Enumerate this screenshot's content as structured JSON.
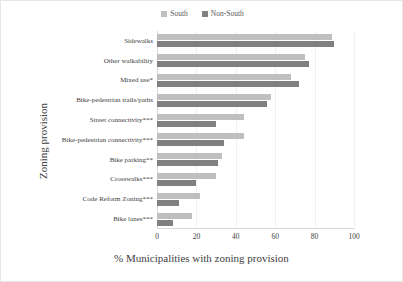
{
  "chart_data": {
    "type": "bar",
    "orientation": "horizontal",
    "title": "",
    "xlabel": "% Municipalities with zoning provision",
    "ylabel": "Zoning provision",
    "xlim": [
      0,
      100
    ],
    "xticks": [
      0,
      20,
      40,
      60,
      80,
      100
    ],
    "grid": true,
    "legend_position": "top-center",
    "categories": [
      "Sidewalks",
      "Other walkability",
      "Mixed use*",
      "Bike-pedestrian trails/paths",
      "Street connectivity***",
      "Bike-pedestrian connectivity***",
      "Bike parking**",
      "Crosswalks***",
      "Code Reform Zoning***",
      "Bike lanes***"
    ],
    "series": [
      {
        "name": "South",
        "color": "#bfbfbf",
        "values": [
          89,
          75,
          68,
          58,
          44,
          44,
          33,
          30,
          22,
          18
        ]
      },
      {
        "name": "Non-South",
        "color": "#808080",
        "values": [
          90,
          77,
          72,
          56,
          30,
          34,
          31,
          20,
          11,
          8
        ]
      }
    ]
  },
  "legend": {
    "items": [
      {
        "label": "South",
        "color": "#bfbfbf"
      },
      {
        "label": "Non-South",
        "color": "#808080"
      }
    ]
  }
}
